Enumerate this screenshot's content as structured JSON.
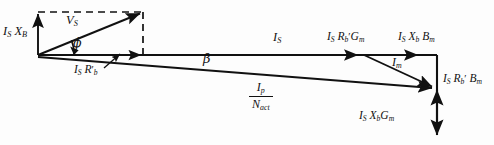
{
  "figure": {
    "kind": "phasor-vector-diagram",
    "stroke_color": "#111111",
    "background_color": "#ffffff",
    "dashed_color": "#111111"
  },
  "labels": {
    "is_xb_vertical": {
      "main1": "I",
      "sub1": "S",
      "main2": "X",
      "sub2": "B"
    },
    "vs": {
      "main1": "V",
      "sub1": "S"
    },
    "phi": "ϕ",
    "is_rb_prime": {
      "main1": "I",
      "sub1": "S",
      "main2": "R",
      "sub2": "b",
      "prime": "′"
    },
    "beta": "β",
    "is": {
      "main1": "I",
      "sub1": "S"
    },
    "is_rb_prime_gm": {
      "main1": "I",
      "sub1": "S",
      "main2": "R",
      "sub2": "b",
      "prime": "′",
      "main3": "G",
      "sub3": "m"
    },
    "is_xb_bm": {
      "main1": "I",
      "sub1": "S",
      "main2": "X",
      "sub2": "b",
      "main3": "B",
      "sub3": "m"
    },
    "im": {
      "main1": "I",
      "sub1": "m"
    },
    "is_rb_prime_bm": {
      "main1": "I",
      "sub1": "S",
      "main2": "R",
      "sub2": "b",
      "prime": "′",
      "main3": "B",
      "sub3": "m"
    },
    "is_xb_gm": {
      "main1": "I",
      "sub1": "S",
      "main2": "X",
      "sub2": "b",
      "main3": "G",
      "sub3": "m"
    },
    "ip_over_nact": {
      "num_main": "I",
      "num_sub": "p",
      "den_main": "N",
      "den_sub": "act"
    }
  },
  "geometry": {
    "origin": {
      "x": 38,
      "y": 55
    },
    "vs_tip": {
      "x": 143,
      "y": 12
    },
    "is_tip": {
      "x": 437,
      "y": 55
    },
    "ip_tip": {
      "x": 437,
      "y": 88
    },
    "vertical_bottom_tip": {
      "x": 437,
      "y": 137
    },
    "rect_top_left": {
      "x": 38,
      "y": 12
    },
    "rect_bottom_right": {
      "x": 143,
      "y": 55
    }
  }
}
